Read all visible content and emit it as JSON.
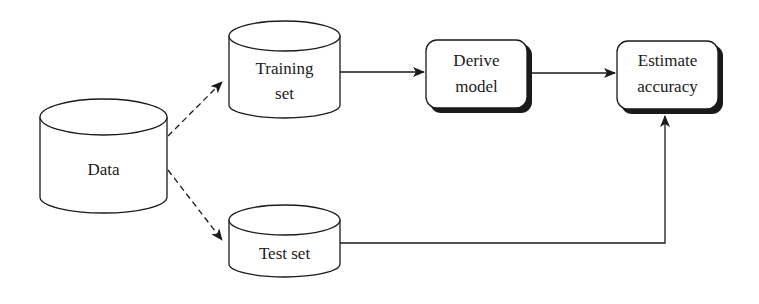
{
  "diagram": {
    "type": "flowchart",
    "nodes": {
      "data": {
        "label": "Data",
        "shape": "cylinder"
      },
      "training_set": {
        "label_line1": "Training",
        "label_line2": "set",
        "shape": "cylinder"
      },
      "test_set": {
        "label": "Test set",
        "shape": "cylinder"
      },
      "derive_model": {
        "label_line1": "Derive",
        "label_line2": "model",
        "shape": "rounded-rectangle"
      },
      "estimate_accuracy": {
        "label_line1": "Estimate",
        "label_line2": "accuracy",
        "shape": "rounded-rectangle"
      }
    },
    "edges": [
      {
        "from": "Data",
        "to": "Training set",
        "style": "dashed"
      },
      {
        "from": "Data",
        "to": "Test set",
        "style": "dashed"
      },
      {
        "from": "Training set",
        "to": "Derive model",
        "style": "solid"
      },
      {
        "from": "Derive model",
        "to": "Estimate accuracy",
        "style": "solid"
      },
      {
        "from": "Test set",
        "to": "Estimate accuracy",
        "style": "solid"
      }
    ],
    "colors": {
      "stroke": "#1a1a1a",
      "background": "#ffffff"
    }
  }
}
